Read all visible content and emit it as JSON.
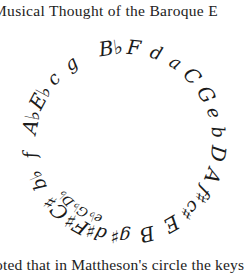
{
  "page": {
    "running_header": "Musical Thought of the Baroque E",
    "body_text_fragment": "oted that in Mattheson's circle the keys of"
  },
  "figure": {
    "center": [
      124,
      142
    ],
    "radius": 95,
    "keys": [
      {
        "label": "B♭",
        "angle": -8
      },
      {
        "label": "F",
        "angle": 6
      },
      {
        "label": "d",
        "angle": 20
      },
      {
        "label": "a",
        "angle": 33
      },
      {
        "label": "C",
        "angle": 46
      },
      {
        "label": "G",
        "angle": 60
      },
      {
        "label": "e",
        "angle": 72
      },
      {
        "label": "b",
        "angle": 84
      },
      {
        "label": "D",
        "angle": 97
      },
      {
        "label": "A",
        "angle": 111
      },
      {
        "label": "f♯",
        "angle": 124
      },
      {
        "label": "c♯",
        "angle": 136
      },
      {
        "label": "E",
        "angle": 150
      },
      {
        "label": "B",
        "angle": 166
      },
      {
        "label": "g♯",
        "angle": 182
      },
      {
        "label": "d♯",
        "angle": 197
      },
      {
        "label": "F♯",
        "angle": 210
      },
      {
        "label": "C♯",
        "angle": 226
      },
      {
        "label": "e♭",
        "angle": 201,
        "inner": true
      },
      {
        "label": "G♭",
        "angle": 213,
        "inner": true
      },
      {
        "label": "D♭",
        "angle": 226,
        "inner": true
      },
      {
        "label": "b♭",
        "angle": 246
      },
      {
        "label": "f",
        "angle": 262
      },
      {
        "label": "A♭",
        "angle": 282
      },
      {
        "label": "E♭",
        "angle": 298
      },
      {
        "label": "c",
        "angle": 312
      },
      {
        "label": "g",
        "angle": 326
      }
    ]
  }
}
